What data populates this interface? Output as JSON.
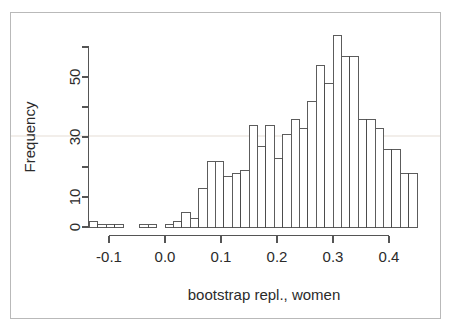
{
  "figure": {
    "background_color": "#ffffff",
    "border_color": "#b9b9b9",
    "bar_fill": "#ffffff",
    "bar_stroke": "#4a4a4a",
    "axis_color": "#555555",
    "text_color": "#2b2b2b"
  },
  "chart_data": {
    "type": "bar",
    "subtype": "histogram",
    "title": "",
    "xlabel": "bootstrap repl., women",
    "ylabel": "Frequency",
    "xlim": [
      -0.135,
      0.455
    ],
    "ylim": [
      0,
      66
    ],
    "grid": false,
    "legend": null,
    "bin_width": 0.015,
    "xticks": [
      -0.1,
      0.0,
      0.1,
      0.2,
      0.3,
      0.4
    ],
    "xtick_labels": [
      "-0.1",
      "0.0",
      "0.1",
      "0.2",
      "0.3",
      "0.4"
    ],
    "yticks": [
      0,
      10,
      20,
      30,
      40,
      50,
      60
    ],
    "ytick_labels": [
      "0",
      "",
      "10",
      "",
      "30",
      "",
      "50"
    ],
    "ytick_labeled": [
      0,
      10,
      30,
      50
    ],
    "ytick_unlabeled": [
      20,
      40,
      60
    ],
    "bin_starts": [
      -0.135,
      -0.12,
      -0.105,
      -0.09,
      -0.075,
      -0.06,
      -0.045,
      -0.03,
      -0.015,
      0.0,
      0.015,
      0.03,
      0.045,
      0.06,
      0.075,
      0.09,
      0.105,
      0.12,
      0.135,
      0.15,
      0.165,
      0.18,
      0.195,
      0.21,
      0.225,
      0.24,
      0.255,
      0.27,
      0.285,
      0.3,
      0.315,
      0.33,
      0.345,
      0.36,
      0.375,
      0.39,
      0.405,
      0.42,
      0.435
    ],
    "bin_centers": [
      -0.1275,
      -0.1125,
      -0.0975,
      -0.0825,
      -0.0675,
      -0.0525,
      -0.0375,
      -0.0225,
      -0.0075,
      0.0075,
      0.0225,
      0.0375,
      0.0525,
      0.0675,
      0.0825,
      0.0975,
      0.1125,
      0.1275,
      0.1425,
      0.1575,
      0.1725,
      0.1875,
      0.2025,
      0.2175,
      0.2325,
      0.2475,
      0.2625,
      0.2775,
      0.2925,
      0.3075,
      0.3225,
      0.3375,
      0.3525,
      0.3675,
      0.3825,
      0.3975,
      0.4125,
      0.4275,
      0.4425
    ],
    "values": [
      2,
      1,
      1,
      1,
      0,
      1,
      1,
      0,
      0,
      2,
      1,
      4,
      3,
      13,
      22,
      22,
      17,
      17,
      18,
      19,
      34,
      27,
      34,
      23,
      31,
      36,
      33,
      42,
      54,
      48,
      64,
      57,
      57,
      36,
      36,
      33,
      26,
      26,
      2
    ],
    "bar_count": 39,
    "peak_value": 64,
    "peak_bin_center": 0.3225
  },
  "bars": [
    {
      "x": -0.135,
      "w": 0.015,
      "h": 2
    },
    {
      "x": -0.12,
      "w": 0.015,
      "h": 1
    },
    {
      "x": -0.105,
      "w": 0.015,
      "h": 1
    },
    {
      "x": -0.09,
      "w": 0.015,
      "h": 1
    },
    {
      "x": -0.075,
      "w": 0.015,
      "h": 0
    },
    {
      "x": -0.06,
      "w": 0.015,
      "h": 0
    },
    {
      "x": -0.045,
      "w": 0.015,
      "h": 1
    },
    {
      "x": -0.03,
      "w": 0.015,
      "h": 1
    },
    {
      "x": -0.015,
      "w": 0.015,
      "h": 0
    },
    {
      "x": 0.0,
      "w": 0.015,
      "h": 1
    },
    {
      "x": 0.015,
      "w": 0.015,
      "h": 2
    },
    {
      "x": 0.03,
      "w": 0.015,
      "h": 5
    },
    {
      "x": 0.045,
      "w": 0.015,
      "h": 3
    },
    {
      "x": 0.06,
      "w": 0.015,
      "h": 13
    },
    {
      "x": 0.075,
      "w": 0.015,
      "h": 22
    },
    {
      "x": 0.09,
      "w": 0.015,
      "h": 22
    },
    {
      "x": 0.105,
      "w": 0.015,
      "h": 17
    },
    {
      "x": 0.12,
      "w": 0.015,
      "h": 18
    },
    {
      "x": 0.135,
      "w": 0.015,
      "h": 19
    },
    {
      "x": 0.15,
      "w": 0.015,
      "h": 34
    },
    {
      "x": 0.165,
      "w": 0.015,
      "h": 27
    },
    {
      "x": 0.18,
      "w": 0.015,
      "h": 34
    },
    {
      "x": 0.195,
      "w": 0.015,
      "h": 23
    },
    {
      "x": 0.21,
      "w": 0.015,
      "h": 31
    },
    {
      "x": 0.225,
      "w": 0.015,
      "h": 36
    },
    {
      "x": 0.24,
      "w": 0.015,
      "h": 33
    },
    {
      "x": 0.255,
      "w": 0.015,
      "h": 42
    },
    {
      "x": 0.27,
      "w": 0.015,
      "h": 54
    },
    {
      "x": 0.285,
      "w": 0.015,
      "h": 48
    },
    {
      "x": 0.3,
      "w": 0.015,
      "h": 64
    },
    {
      "x": 0.315,
      "w": 0.015,
      "h": 57
    },
    {
      "x": 0.33,
      "w": 0.015,
      "h": 57
    },
    {
      "x": 0.345,
      "w": 0.015,
      "h": 36
    },
    {
      "x": 0.36,
      "w": 0.015,
      "h": 36
    },
    {
      "x": 0.375,
      "w": 0.015,
      "h": 33
    },
    {
      "x": 0.39,
      "w": 0.015,
      "h": 26
    },
    {
      "x": 0.405,
      "w": 0.015,
      "h": 26
    },
    {
      "x": 0.42,
      "w": 0.015,
      "h": 18
    },
    {
      "x": 0.435,
      "w": 0.015,
      "h": 18
    }
  ]
}
